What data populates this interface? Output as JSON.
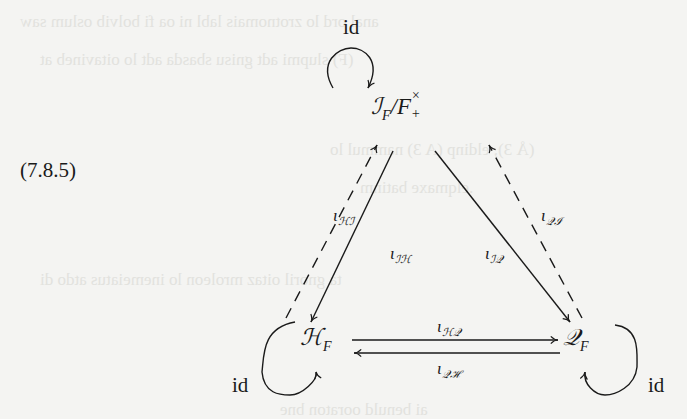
{
  "equation_number": "(7.8.5)",
  "nodes": {
    "top": {
      "base": "ℐ",
      "sub": "F",
      "slash": "/F",
      "sup": "×",
      "subsup": "+"
    },
    "left": {
      "base": "ℋ",
      "sub": "F"
    },
    "right": {
      "base": "𝒬",
      "sub": "F"
    }
  },
  "loops": {
    "top": {
      "label": "id"
    },
    "left": {
      "label": "id"
    },
    "right": {
      "label": "id"
    }
  },
  "arrows": {
    "H_to_I": {
      "symbol": "ι",
      "sub": "ℋℐ",
      "style": "dashed"
    },
    "I_to_H": {
      "symbol": "ι",
      "sub": "ℐℋ",
      "style": "solid"
    },
    "I_to_Q": {
      "symbol": "ι",
      "sub": "ℐ𝒬",
      "style": "solid"
    },
    "Q_to_I": {
      "symbol": "ι",
      "sub": "𝒬ℐ",
      "style": "dashed"
    },
    "H_to_Q": {
      "symbol": "ι",
      "sub": "ℋ𝒬",
      "style": "solid"
    },
    "Q_to_H": {
      "symbol": "ι",
      "sub": "𝒬ℋ",
      "style": "solid"
    }
  },
  "colors": {
    "ink": "#1a1a1a",
    "paper": "#f4f4f2"
  }
}
